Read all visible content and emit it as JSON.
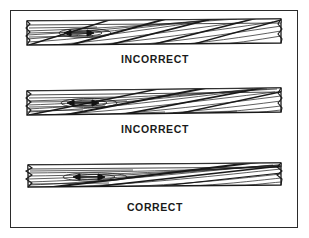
{
  "figure": {
    "background_color": "#ffffff",
    "border_color": "#2b2b2b",
    "line_color": "#1a1a1a"
  },
  "panels": [
    {
      "id": "panel-incorrect-1",
      "caption": "INCORRECT",
      "arrow_icon": "double-headed-arrow-icon",
      "grain_description": "Steep cross-grain slope running across board",
      "slope_label": "steep",
      "end_mark_left": "break-mark",
      "end_mark_right": "break-mark"
    },
    {
      "id": "panel-incorrect-2",
      "caption": "INCORRECT",
      "arrow_icon": "double-headed-arrow-icon",
      "grain_description": "Moderate cross-grain slope running across board",
      "slope_label": "moderate",
      "end_mark_left": "break-mark",
      "end_mark_right": "break-mark"
    },
    {
      "id": "panel-correct",
      "caption": "CORRECT",
      "arrow_icon": "double-headed-arrow-icon",
      "grain_description": "Shallow grain slope nearly parallel to board length",
      "slope_label": "shallow",
      "end_mark_left": "break-mark",
      "end_mark_right": "break-mark"
    }
  ]
}
